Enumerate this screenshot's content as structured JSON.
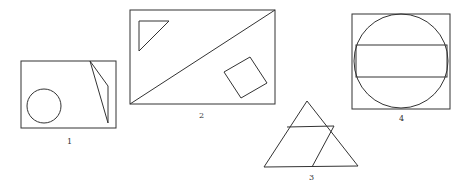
{
  "figures": [
    {
      "label": "1",
      "description": "square containing a circle and a thin quadrilateral"
    },
    {
      "label": "2",
      "description": "rectangle split by a diagonal, with a small triangle and a tilted square"
    },
    {
      "label": "3",
      "description": "triangle divided by a horizontal line and a slanted line"
    },
    {
      "label": "4",
      "description": "square with inscribed circle and a horizontal rectangle"
    }
  ],
  "colors": {
    "stroke": "#333333",
    "background": "#ffffff"
  }
}
